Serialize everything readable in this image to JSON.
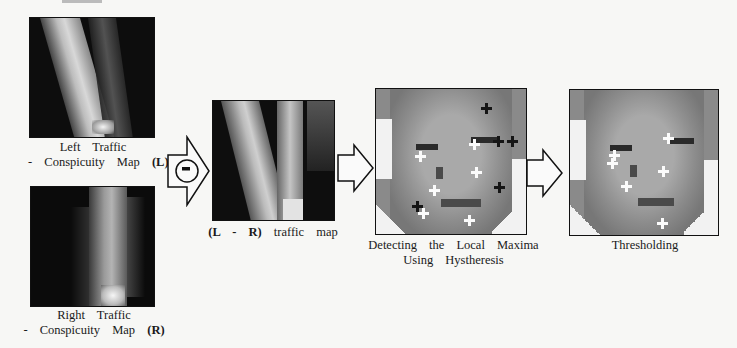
{
  "figure": {
    "left_map": {
      "caption_line1": "Left Traffic",
      "caption_line2_prefix": "- Conspicuity Map",
      "caption_symbol": "(L)"
    },
    "right_map": {
      "caption_line1": "Right Traffic",
      "caption_line2_prefix": "- Conspicuity Map",
      "caption_symbol": "(R)"
    },
    "difference_operator": {
      "icon": "minus-in-circle-icon",
      "symbol": "−"
    },
    "difference_map": {
      "caption_symbol": "(L - R)",
      "caption_suffix": "traffic map"
    },
    "local_maxima": {
      "caption_line1": "Detecting the Local Maxima",
      "caption_line2": "Using Hystheresis",
      "markers": {
        "white": [
          [
            44,
            72
          ],
          [
            98,
            60
          ],
          [
            47,
            127
          ],
          [
            100,
            88
          ],
          [
            58,
            104
          ],
          [
            93,
            133
          ]
        ],
        "black": [
          [
            110,
            20
          ],
          [
            122,
            54
          ],
          [
            142,
            56
          ],
          [
            124,
            100
          ],
          [
            40,
            118
          ]
        ]
      }
    },
    "threshold": {
      "caption": "Thresholding",
      "markers": {
        "white": [
          [
            44,
            72
          ],
          [
            98,
            60
          ],
          [
            42,
            98
          ],
          [
            92,
            92
          ],
          [
            55,
            120
          ],
          [
            91,
            142
          ]
        ]
      }
    },
    "flow_arrows": [
      "arrow-right-icon",
      "arrow-right-icon"
    ]
  }
}
